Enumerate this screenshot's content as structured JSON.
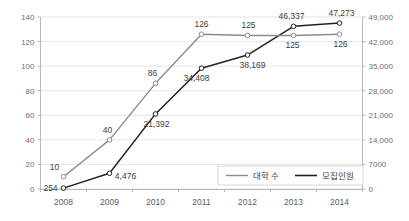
{
  "chart_data": {
    "type": "line",
    "title": "",
    "subtitle": "",
    "xlabel": "",
    "ylabel": "",
    "categories": [
      "2008",
      "2009",
      "2010",
      "2011",
      "2012",
      "2013",
      "2014"
    ],
    "grid": true,
    "legend_position": "bottom-right-inside",
    "axes": {
      "left": {
        "ylabel": "",
        "ylim": [
          0,
          140
        ],
        "ticks": [
          0,
          20,
          40,
          60,
          80,
          100,
          120,
          140
        ],
        "tick_labels": [
          "0",
          "20",
          "40",
          "60",
          "80",
          "100",
          "120",
          "140"
        ]
      },
      "right": {
        "ylabel": "",
        "ylim": [
          0,
          49000
        ],
        "ticks": [
          0,
          7000,
          14000,
          21000,
          28000,
          35000,
          42000,
          49000
        ],
        "tick_labels": [
          "0",
          "7000",
          "14,000",
          "21,000",
          "28,000",
          "35,000",
          "42,000",
          "49,000"
        ]
      }
    },
    "series": [
      {
        "name": "대학 수",
        "axis": "left",
        "color": "#8c8c8c",
        "marker": "open-circle",
        "values": [
          10,
          40,
          86,
          126,
          125,
          125,
          126
        ],
        "value_labels": [
          "10",
          "40",
          "86",
          "126",
          "125",
          "125",
          "126"
        ]
      },
      {
        "name": "모집인원",
        "axis": "right",
        "color": "#222222",
        "marker": "open-circle",
        "values": [
          254,
          4476,
          21392,
          34408,
          38169,
          46337,
          47273
        ],
        "value_labels": [
          "254",
          "4,476",
          "21,392",
          "34,408",
          "38,169",
          "46,337",
          "47,273"
        ]
      }
    ]
  },
  "legend": {
    "items": [
      {
        "label": "대학 수"
      },
      {
        "label": "모집인원"
      }
    ]
  },
  "colors": {
    "series_universities": "#8c8c8c",
    "series_quota": "#222222",
    "gridline": "#d9d9d9",
    "axis": "#a8a8a8",
    "text": "#444444",
    "background": "#ffffff"
  }
}
